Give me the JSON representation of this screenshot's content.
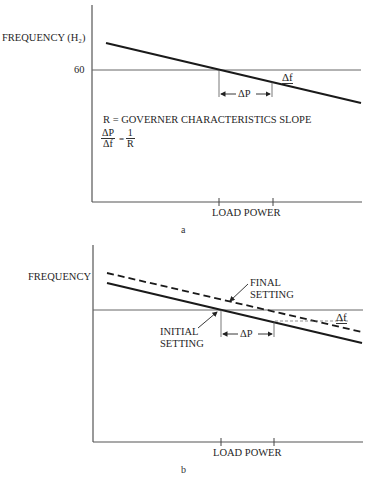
{
  "diagram_a": {
    "y_label": "FREQUENCY (H₂)",
    "y_tick": "60",
    "x_label": "LOAD POWER",
    "delta_p": "ΔP",
    "delta_f": "Δf",
    "definition": "R = GOVERNER CHARACTERISTICS SLOPE",
    "formula": {
      "num_left": "ΔP",
      "den_left": "Δf",
      "equals": "=",
      "num_right": "1",
      "den_right": "R"
    },
    "caption": "a"
  },
  "diagram_b": {
    "y_label": "FREQUENCY",
    "x_label": "LOAD POWER",
    "final_setting": [
      "FINAL",
      "SETTING"
    ],
    "initial_setting": [
      "INITIAL",
      "SETTING"
    ],
    "delta_p": "ΔP",
    "delta_f": "Δf",
    "caption": "b"
  },
  "colors": {
    "line": "#1a1a1a",
    "axis": "#555555",
    "reference": "#666666"
  }
}
